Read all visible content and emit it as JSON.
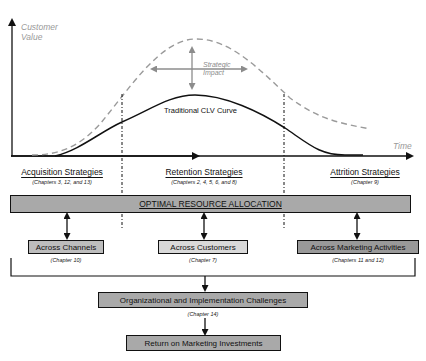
{
  "chart": {
    "y_axis_label_line1": "Customer",
    "y_axis_label_line2": "Value",
    "x_axis_label": "Time",
    "strategic_impact_line1": "Strategic",
    "strategic_impact_line2": "Impact",
    "curve_label": "Traditional CLV Curve"
  },
  "strategies": [
    {
      "label": "Acquisition Strategies",
      "chapters": "(Chapters 3, 12, and 13)"
    },
    {
      "label": "Retention Strategies",
      "chapters": "(Chapters 2, 4, 5, 6, and 8)"
    },
    {
      "label": "Attrition Strategies",
      "chapters": "(Chapter 9)"
    }
  ],
  "allocation": {
    "label": "OPTIMAL RESOURCE ALLOCATION"
  },
  "dimensions": [
    {
      "label": "Across Channels",
      "chapters": "(Chapter 10)"
    },
    {
      "label": "Across Customers",
      "chapters": "(Chapter 7)"
    },
    {
      "label": "Across Marketing Activities",
      "chapters": "(Chapters 11 and 12)"
    }
  ],
  "challenges": {
    "label": "Organizational and Implementation Challenges",
    "chapters": "(Chapter 14)"
  },
  "outcome": {
    "label": "Return on Marketing Investments"
  },
  "colors": {
    "axis": "#111111",
    "dashed_curve": "#9a9a9a",
    "impact_arrows": "#8c8c8c",
    "allocation_fill": "#a9a9a9",
    "box_fill_light": "#d9d9d9"
  }
}
